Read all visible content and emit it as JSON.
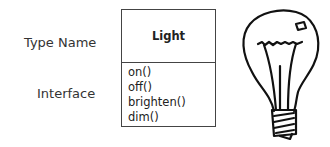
{
  "labels": {
    "type_name": "Type Name",
    "interface": "Interface"
  },
  "uml_class": {
    "name": "Light",
    "methods": [
      "on()",
      "off()",
      "brighten()",
      "dim()"
    ]
  },
  "illustration": {
    "icon": "light-bulb-icon"
  }
}
